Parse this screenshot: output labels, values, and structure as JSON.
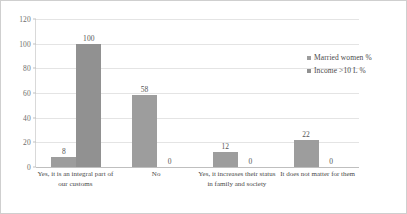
{
  "chart_data": {
    "type": "bar",
    "title": "",
    "subtitle": "",
    "xlabel": "",
    "ylabel": "",
    "ylim": [
      0,
      120
    ],
    "ytick_labels": [
      "0",
      "20",
      "40",
      "60",
      "80",
      "100",
      "120"
    ],
    "yticks": [
      0,
      20,
      40,
      60,
      80,
      100,
      120
    ],
    "grid": true,
    "legend_position": "right",
    "categories": [
      "Yes, it is an integral part of our customs",
      "No",
      "Yes, it increases their status in family and society",
      "It does not matter for them"
    ],
    "series": [
      {
        "name": "Married women %",
        "color": "#9d9d9d",
        "values": [
          8,
          58,
          12,
          22
        ],
        "value_labels": [
          "8",
          "58",
          "12",
          "22"
        ]
      },
      {
        "name": "Income >10 L %",
        "color": "#919191",
        "values": [
          100,
          0,
          0,
          0
        ],
        "value_labels": [
          "100",
          "0",
          "0",
          "0"
        ]
      }
    ]
  },
  "legend": {
    "items": [
      {
        "label": "Married women %",
        "marker": "legend-square-marker"
      },
      {
        "label": "Income >10 L %",
        "marker": "legend-square-marker"
      }
    ]
  }
}
